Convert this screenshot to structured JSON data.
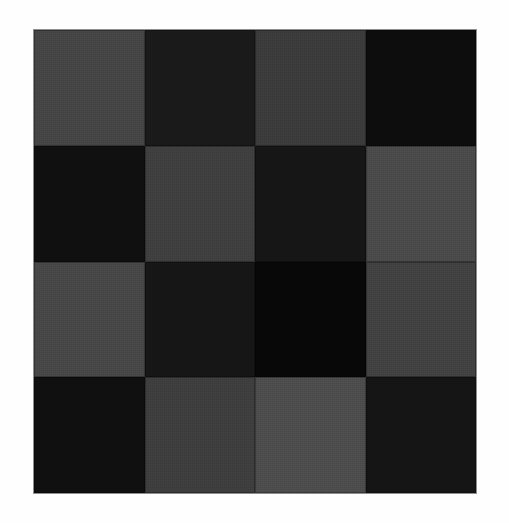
{
  "artwork": {
    "title": "Checkerboard Grid",
    "background_color": "#fefefe",
    "plate": {
      "border_color": "#8f8f8f",
      "left": 33,
      "top": 29,
      "width": 444,
      "height": 465,
      "rows": 4,
      "columns": 4,
      "cell_width": 111,
      "cell_height": 116,
      "texture": "woven-canvas-noise"
    },
    "palette": {
      "light_gray": "#4c4c4c",
      "medium_gray": "#464646",
      "medium_dark_gray": "#3e3e3e",
      "dark_gray": "#383838",
      "near_black": "#181818",
      "deep_black": "#101010",
      "pure_black": "#080808"
    },
    "tiles": [
      {
        "row": 0,
        "col": 0,
        "name": "tile-r0c0",
        "tone": "medium_gray",
        "color": "#454545"
      },
      {
        "row": 0,
        "col": 1,
        "name": "tile-r0c1",
        "tone": "near_black",
        "color": "#1a1a1a"
      },
      {
        "row": 0,
        "col": 2,
        "name": "tile-r0c2",
        "tone": "dark_gray",
        "color": "#3b3b3b"
      },
      {
        "row": 0,
        "col": 3,
        "name": "tile-r0c3",
        "tone": "deep_black",
        "color": "#0d0d0d"
      },
      {
        "row": 1,
        "col": 0,
        "name": "tile-r1c0",
        "tone": "deep_black",
        "color": "#101010"
      },
      {
        "row": 1,
        "col": 1,
        "name": "tile-r1c1",
        "tone": "medium_dark_gray",
        "color": "#3f3f3f"
      },
      {
        "row": 1,
        "col": 2,
        "name": "tile-r1c2",
        "tone": "near_black",
        "color": "#161616"
      },
      {
        "row": 1,
        "col": 3,
        "name": "tile-r1c3",
        "tone": "light_gray",
        "color": "#4a4a4a"
      },
      {
        "row": 2,
        "col": 0,
        "name": "tile-r2c0",
        "tone": "medium_gray",
        "color": "#474747"
      },
      {
        "row": 2,
        "col": 1,
        "name": "tile-r2c1",
        "tone": "near_black",
        "color": "#161616"
      },
      {
        "row": 2,
        "col": 2,
        "name": "tile-r2c2",
        "tone": "pure_black",
        "color": "#080808"
      },
      {
        "row": 2,
        "col": 3,
        "name": "tile-r2c3",
        "tone": "medium_dark_gray",
        "color": "#414141"
      },
      {
        "row": 3,
        "col": 0,
        "name": "tile-r3c0",
        "tone": "deep_black",
        "color": "#0f0f0f"
      },
      {
        "row": 3,
        "col": 1,
        "name": "tile-r3c1",
        "tone": "medium_dark_gray",
        "color": "#3e3e3e"
      },
      {
        "row": 3,
        "col": 2,
        "name": "tile-r3c2",
        "tone": "light_gray",
        "color": "#4d4d4d"
      },
      {
        "row": 3,
        "col": 3,
        "name": "tile-r3c3",
        "tone": "near_black",
        "color": "#151515"
      }
    ]
  }
}
